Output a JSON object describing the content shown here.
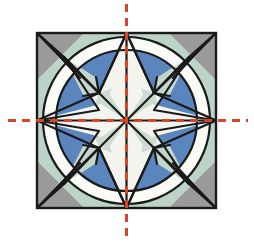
{
  "figure": {
    "title": "Symmetry figure: square tile with inscribed circle and eight-point star",
    "caption": "",
    "canvas": {
      "width": 254,
      "height": 243,
      "background": "#ffffff"
    }
  },
  "geometry": {
    "square": {
      "left": 37,
      "top": 33,
      "right": 216,
      "bottom": 208
    },
    "center": {
      "x": 126.5,
      "y": 120.5
    },
    "circle": {
      "cx": 126.5,
      "cy": 120.5,
      "r": 83.5
    },
    "inner_circle": {
      "cx": 126.5,
      "cy": 120.5,
      "r": 70.5
    },
    "star_outer_points": [
      {
        "name": "top",
        "x": 126.5,
        "y": 33
      },
      {
        "name": "right",
        "x": 216,
        "y": 120.5
      },
      {
        "name": "bottom",
        "x": 126.5,
        "y": 208
      },
      {
        "name": "left",
        "x": 37,
        "y": 120.5
      },
      {
        "name": "top-right-diagonal",
        "x": 189,
        "y": 57
      },
      {
        "name": "bottom-right-diagonal",
        "x": 189,
        "y": 184
      },
      {
        "name": "bottom-left-diagonal",
        "x": 64,
        "y": 184
      },
      {
        "name": "top-left-diagonal",
        "x": 64,
        "y": 57
      }
    ],
    "inner_nodes": [
      {
        "name": "node-upper-left",
        "x": 99,
        "y": 93
      },
      {
        "name": "node-upper-right",
        "x": 154,
        "y": 93
      },
      {
        "name": "node-lower-right",
        "x": 154,
        "y": 148
      },
      {
        "name": "node-lower-left",
        "x": 99,
        "y": 148
      }
    ]
  },
  "axes": {
    "vertical": {
      "label": "vertical-axis-of-symmetry",
      "x": 126.5,
      "y1": 4,
      "y2": 239,
      "style": "dashed",
      "color": "#d6442a"
    },
    "horizontal": {
      "label": "horizontal-axis-of-symmetry",
      "y": 120.5,
      "x1": 8,
      "x2": 248,
      "style": "dashed",
      "color": "#d6442a"
    }
  },
  "colors": {
    "outline": "#1a1a1a",
    "blue": "#5b86bd",
    "blue_dark": "#4672ad",
    "green": "#bcd4c8",
    "green_mid": "#c3d6cb",
    "gray": "#9a9a9a",
    "gray_light": "#b5b5b5",
    "cream": "#f4f4ee",
    "white": "#fbfbf7",
    "pale_sage": "#ccdcd1",
    "axis_red": "#d6442a",
    "background": "#ffffff"
  },
  "legend": {
    "items": [
      {
        "label": "Axis of symmetry",
        "color": "#d6442a"
      },
      {
        "label": "Blue petal region",
        "color": "#5b86bd"
      },
      {
        "label": "Green corner region",
        "color": "#bcd4c8"
      },
      {
        "label": "Gray corner region",
        "color": "#9a9a9a"
      },
      {
        "label": "Cream star region",
        "color": "#f4f4ee"
      }
    ]
  }
}
